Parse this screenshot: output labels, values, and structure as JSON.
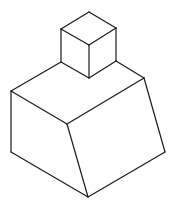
{
  "figure": {
    "stroke_color": "#1a1a1a",
    "background": "#ffffff",
    "small_cube": {
      "edges": [
        [
          [
            89,
            12
          ],
          [
            61,
            29
          ]
        ],
        [
          [
            89,
            12
          ],
          [
            116,
            28
          ]
        ],
        [
          [
            61,
            29
          ],
          [
            89,
            45
          ]
        ],
        [
          [
            116,
            28
          ],
          [
            89,
            45
          ]
        ],
        [
          [
            61,
            29
          ],
          [
            61,
            62
          ]
        ],
        [
          [
            89,
            45
          ],
          [
            89,
            78
          ]
        ],
        [
          [
            116,
            28
          ],
          [
            116,
            61
          ]
        ],
        [
          [
            61,
            62
          ],
          [
            89,
            78
          ]
        ],
        [
          [
            89,
            78
          ],
          [
            116,
            61
          ]
        ]
      ]
    },
    "large_block": {
      "edges": [
        [
          [
            61,
            62
          ],
          [
            11,
            91
          ]
        ],
        [
          [
            116,
            61
          ],
          [
            144,
            78
          ]
        ],
        [
          [
            11,
            91
          ],
          [
            67,
            124
          ]
        ],
        [
          [
            67,
            124
          ],
          [
            144,
            78
          ]
        ],
        [
          [
            11,
            91
          ],
          [
            11,
            152
          ]
        ],
        [
          [
            67,
            124
          ],
          [
            88,
            197
          ]
        ],
        [
          [
            144,
            78
          ],
          [
            165,
            152
          ]
        ],
        [
          [
            11,
            152
          ],
          [
            88,
            197
          ]
        ],
        [
          [
            88,
            197
          ],
          [
            165,
            152
          ]
        ]
      ]
    }
  }
}
